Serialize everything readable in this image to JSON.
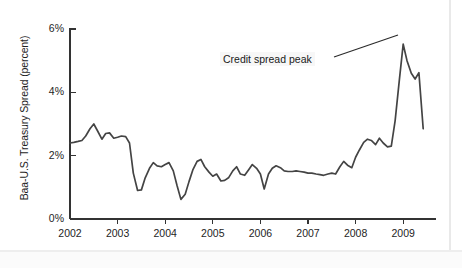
{
  "figure": {
    "background_color": "#ffffff",
    "line_color": "#444444",
    "axis_color": "#333333",
    "text_color": "#1e1e1e"
  },
  "annotations": [
    {
      "name": "credit-spread-peak",
      "text": "Credit spread peak",
      "x": 220,
      "y": 52,
      "leader_from_x": 334,
      "leader_from_y": 57,
      "leader_to_x": 398,
      "leader_to_y": 35
    }
  ],
  "chart_data": {
    "type": "line",
    "title": "",
    "subtitle": "",
    "xlabel": "",
    "ylabel": "Baa-U.S. Treasury Spread (percent)",
    "xlim": [
      2002.0,
      2009.5
    ],
    "ylim": [
      0,
      6
    ],
    "grid": false,
    "legend": false,
    "legend_position": "none",
    "ytick_labels": [
      "0%",
      "2%",
      "4%",
      "6%"
    ],
    "ytick_values": [
      0,
      2,
      4,
      6
    ],
    "xtick_labels": [
      "2002",
      "2003",
      "2004",
      "2005",
      "2006",
      "2007",
      "2008",
      "2009"
    ],
    "xtick_values": [
      2002,
      2003,
      2004,
      2005,
      2006,
      2007,
      2008,
      2009
    ],
    "series": [
      {
        "name": "Baa-U.S. Treasury Spread",
        "x": [
          2002.0,
          2002.08,
          2002.17,
          2002.25,
          2002.33,
          2002.42,
          2002.5,
          2002.58,
          2002.67,
          2002.75,
          2002.83,
          2002.92,
          2003.0,
          2003.08,
          2003.17,
          2003.25,
          2003.33,
          2003.42,
          2003.5,
          2003.58,
          2003.67,
          2003.75,
          2003.83,
          2003.92,
          2004.0,
          2004.08,
          2004.17,
          2004.25,
          2004.33,
          2004.42,
          2004.5,
          2004.58,
          2004.67,
          2004.75,
          2004.83,
          2004.92,
          2005.0,
          2005.08,
          2005.17,
          2005.25,
          2005.33,
          2005.42,
          2005.5,
          2005.58,
          2005.67,
          2005.75,
          2005.83,
          2005.92,
          2006.0,
          2006.08,
          2006.17,
          2006.25,
          2006.33,
          2006.42,
          2006.5,
          2006.58,
          2006.67,
          2006.75,
          2006.83,
          2006.92,
          2007.0,
          2007.08,
          2007.17,
          2007.25,
          2007.33,
          2007.42,
          2007.5,
          2007.58,
          2007.67,
          2007.75,
          2007.83,
          2007.92,
          2008.0,
          2008.08,
          2008.17,
          2008.25,
          2008.33,
          2008.42,
          2008.5,
          2008.58,
          2008.67,
          2008.75,
          2008.83,
          2008.92,
          2009.0,
          2009.08,
          2009.17,
          2009.25,
          2009.33,
          2009.42
        ],
        "values": [
          2.4,
          2.42,
          2.45,
          2.48,
          2.62,
          2.85,
          3.0,
          2.78,
          2.52,
          2.7,
          2.72,
          2.55,
          2.58,
          2.62,
          2.6,
          2.4,
          1.45,
          0.9,
          0.92,
          1.3,
          1.6,
          1.78,
          1.68,
          1.65,
          1.72,
          1.78,
          1.52,
          1.05,
          0.62,
          0.78,
          1.18,
          1.55,
          1.82,
          1.88,
          1.65,
          1.48,
          1.35,
          1.42,
          1.2,
          1.22,
          1.3,
          1.52,
          1.65,
          1.42,
          1.38,
          1.55,
          1.72,
          1.6,
          1.42,
          0.95,
          1.42,
          1.6,
          1.68,
          1.62,
          1.52,
          1.5,
          1.5,
          1.52,
          1.5,
          1.48,
          1.45,
          1.45,
          1.42,
          1.4,
          1.38,
          1.42,
          1.45,
          1.42,
          1.65,
          1.82,
          1.7,
          1.62,
          1.95,
          2.18,
          2.42,
          2.52,
          2.48,
          2.35,
          2.55,
          2.4,
          2.28,
          2.3,
          3.1,
          4.4,
          5.52,
          5.0,
          4.6,
          4.42,
          4.62,
          2.85
        ]
      }
    ],
    "annotations": [
      {
        "label": "Credit spread peak",
        "x": 2008.95,
        "y": 5.52
      }
    ]
  }
}
